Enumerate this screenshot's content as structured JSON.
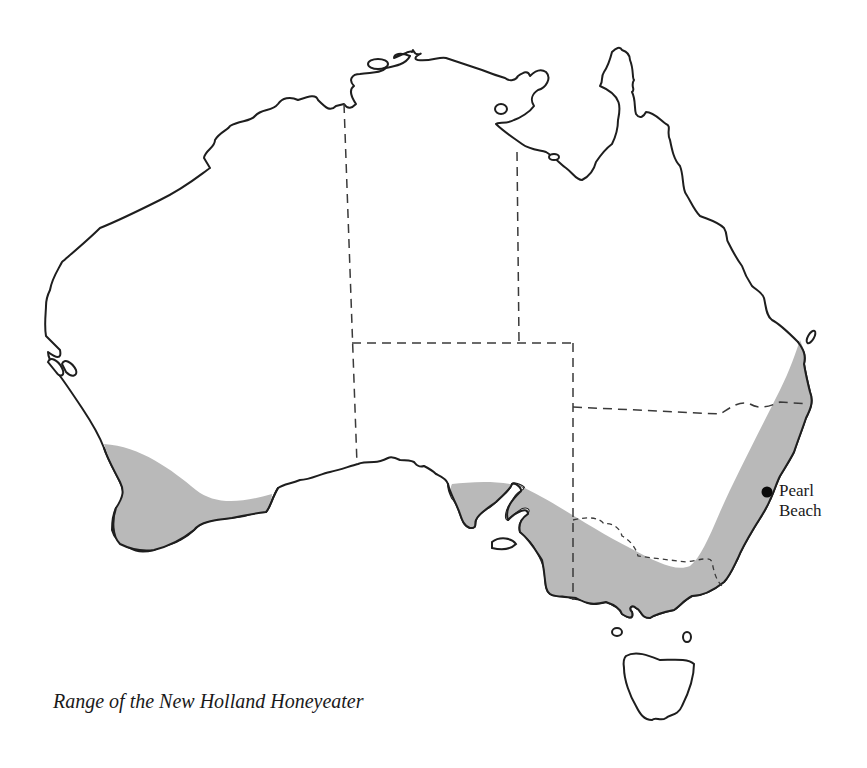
{
  "map": {
    "subject": "Australia",
    "range_color": "#b9b9b9",
    "outline_color": "#1e1e1e",
    "marker_color": "#0a0a0a",
    "places": [
      {
        "name": "pearl-beach",
        "label_line1": "Pearl",
        "label_line2": "Beach"
      }
    ],
    "legend": {
      "shaded_area": "Range of species",
      "dashed_lines": "State borders"
    }
  },
  "caption": {
    "text": "Range of the New Holland Honeyeater"
  }
}
